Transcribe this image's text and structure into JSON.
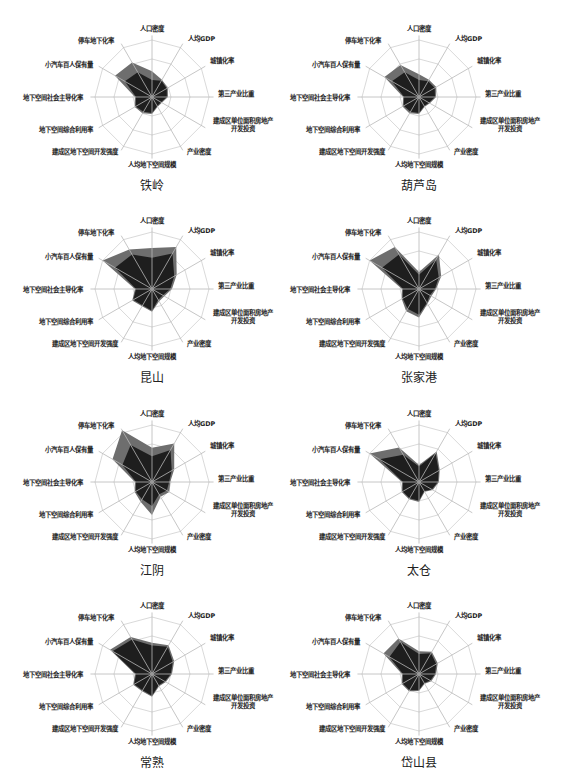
{
  "axes": [
    "人口密度",
    "人均GDP",
    "城镇化率",
    "第三产业比重",
    "建成区单位面积房地产\n开发投资",
    "产业密度",
    "人均地下空间规模",
    "建成区地下空间开发强度",
    "地下空间综合利用率",
    "地下空间社会主导化率",
    "小汽车百人保有量",
    "停车地下化率"
  ],
  "colors": {
    "outer_fill": "#6e6e6e",
    "inner_fill": "#1e1e1e",
    "grid": "#cfcfcf",
    "axis": "#cfcfcf",
    "spoke": "#b8b8b8"
  },
  "chart_data": [
    {
      "type": "radar",
      "title": "铁岭",
      "categories": [
        "人口密度",
        "人均GDP",
        "城镇化率",
        "第三产业比重",
        "建成区单位面积房地产开发投资",
        "产业密度",
        "人均地下空间规模",
        "建成区地下空间开发强度",
        "地下空间综合利用率",
        "地下空间社会主导化率",
        "小汽车百人保有量",
        "停车地下化率"
      ],
      "series": [
        {
          "name": "outer",
          "values": [
            0.45,
            0.35,
            0.32,
            0.28,
            0.2,
            0.2,
            0.3,
            0.33,
            0.35,
            0.3,
            0.75,
            0.7
          ]
        },
        {
          "name": "inner",
          "values": [
            0.3,
            0.33,
            0.3,
            0.26,
            0.18,
            0.18,
            0.28,
            0.3,
            0.33,
            0.28,
            0.55,
            0.5
          ]
        }
      ]
    },
    {
      "type": "radar",
      "title": "葫芦岛",
      "categories": [
        "人口密度",
        "人均GDP",
        "城镇化率",
        "第三产业比重",
        "建成区单位面积房地产开发投资",
        "产业密度",
        "人均地下空间规模",
        "建成区地下空间开发强度",
        "地下空间综合利用率",
        "地下空间社会主导化率",
        "小汽车百人保有量",
        "停车地下化率"
      ],
      "series": [
        {
          "name": "outer",
          "values": [
            0.4,
            0.35,
            0.35,
            0.3,
            0.22,
            0.2,
            0.3,
            0.33,
            0.33,
            0.28,
            0.7,
            0.65
          ]
        },
        {
          "name": "inner",
          "values": [
            0.3,
            0.32,
            0.32,
            0.28,
            0.2,
            0.18,
            0.28,
            0.3,
            0.31,
            0.26,
            0.55,
            0.5
          ]
        }
      ]
    },
    {
      "type": "radar",
      "title": "昆山",
      "categories": [
        "人口密度",
        "人均GDP",
        "城镇化率",
        "第三产业比重",
        "建成区单位面积房地产开发投资",
        "产业密度",
        "人均地下空间规模",
        "建成区地下空间开发强度",
        "地下空间综合利用率",
        "地下空间社会主导化率",
        "小汽车百人保有量",
        "停车地下化率"
      ],
      "series": [
        {
          "name": "outer",
          "values": [
            0.72,
            0.85,
            0.5,
            0.35,
            0.25,
            0.25,
            0.4,
            0.35,
            0.4,
            0.3,
            1.0,
            0.8
          ]
        },
        {
          "name": "inner",
          "values": [
            0.55,
            0.72,
            0.45,
            0.32,
            0.22,
            0.22,
            0.38,
            0.33,
            0.38,
            0.28,
            0.75,
            0.7
          ]
        }
      ]
    },
    {
      "type": "radar",
      "title": "张家港",
      "categories": [
        "人口密度",
        "人均GDP",
        "城镇化率",
        "第三产业比重",
        "建成区单位面积房地产开发投资",
        "产业密度",
        "人均地下空间规模",
        "建成区地下空间开发强度",
        "地下空间综合利用率",
        "地下空间社会主导化率",
        "小汽车百人保有量",
        "停车地下化率"
      ],
      "series": [
        {
          "name": "outer",
          "values": [
            0.3,
            0.7,
            0.45,
            0.3,
            0.25,
            0.3,
            0.5,
            0.45,
            0.35,
            0.3,
            1.0,
            0.85
          ]
        },
        {
          "name": "inner",
          "values": [
            0.25,
            0.6,
            0.4,
            0.28,
            0.22,
            0.28,
            0.45,
            0.4,
            0.33,
            0.28,
            0.75,
            0.7
          ]
        }
      ]
    },
    {
      "type": "radar",
      "title": "江阴",
      "categories": [
        "人口密度",
        "人均GDP",
        "城镇化率",
        "第三产业比重",
        "建成区单位面积房地产开发投资",
        "产业密度",
        "人均地下空间规模",
        "建成区地下空间开发强度",
        "地下空间综合利用率",
        "地下空间社会主导化率",
        "小汽车百人保有量",
        "停车地下化率"
      ],
      "series": [
        {
          "name": "outer",
          "values": [
            0.6,
            0.78,
            0.45,
            0.32,
            0.35,
            0.3,
            0.58,
            0.4,
            0.35,
            0.3,
            0.8,
            1.05
          ]
        },
        {
          "name": "inner",
          "values": [
            0.45,
            0.65,
            0.4,
            0.3,
            0.3,
            0.25,
            0.42,
            0.35,
            0.33,
            0.28,
            0.6,
            0.75
          ]
        }
      ]
    },
    {
      "type": "radar",
      "title": "太仓",
      "categories": [
        "人口密度",
        "人均GDP",
        "城镇化率",
        "第三产业比重",
        "建成区单位面积房地产开发投资",
        "产业密度",
        "人均地下空间规模",
        "建成区地下空间开发强度",
        "地下空间综合利用率",
        "地下空间社会主导化率",
        "小汽车百人保有量",
        "停车地下化率"
      ],
      "series": [
        {
          "name": "outer",
          "values": [
            0.3,
            0.62,
            0.42,
            0.35,
            0.28,
            0.2,
            0.35,
            0.35,
            0.35,
            0.3,
            1.0,
            0.7
          ]
        },
        {
          "name": "inner",
          "values": [
            0.27,
            0.58,
            0.4,
            0.33,
            0.26,
            0.18,
            0.33,
            0.33,
            0.33,
            0.28,
            0.8,
            0.55
          ]
        }
      ]
    },
    {
      "type": "radar",
      "title": "常熟",
      "categories": [
        "人口密度",
        "人均GDP",
        "城镇化率",
        "第三产业比重",
        "建成区单位面积房地产开发投资",
        "产业密度",
        "人均地下空间规模",
        "建成区地下空间开发强度",
        "地下空间综合利用率",
        "地下空间社会主导化率",
        "小汽车百人保有量",
        "停车地下化率"
      ],
      "series": [
        {
          "name": "outer",
          "values": [
            0.55,
            0.58,
            0.45,
            0.35,
            0.28,
            0.25,
            0.4,
            0.35,
            0.38,
            0.3,
            0.85,
            0.75
          ]
        },
        {
          "name": "inner",
          "values": [
            0.5,
            0.55,
            0.42,
            0.33,
            0.26,
            0.23,
            0.38,
            0.33,
            0.36,
            0.28,
            0.8,
            0.7
          ]
        }
      ]
    },
    {
      "type": "radar",
      "title": "岱山县",
      "categories": [
        "人口密度",
        "人均GDP",
        "城镇化率",
        "第三产业比重",
        "建成区单位面积房地产开发投资",
        "产业密度",
        "人均地下空间规模",
        "建成区地下空间开发强度",
        "地下空间综合利用率",
        "地下空间社会主导化率",
        "小汽车百人保有量",
        "停车地下化率"
      ],
      "series": [
        {
          "name": "outer",
          "values": [
            0.4,
            0.45,
            0.38,
            0.3,
            0.25,
            0.2,
            0.3,
            0.35,
            0.35,
            0.3,
            0.72,
            0.72
          ]
        },
        {
          "name": "inner",
          "values": [
            0.35,
            0.42,
            0.35,
            0.28,
            0.23,
            0.18,
            0.28,
            0.33,
            0.33,
            0.28,
            0.6,
            0.65
          ]
        }
      ]
    }
  ]
}
